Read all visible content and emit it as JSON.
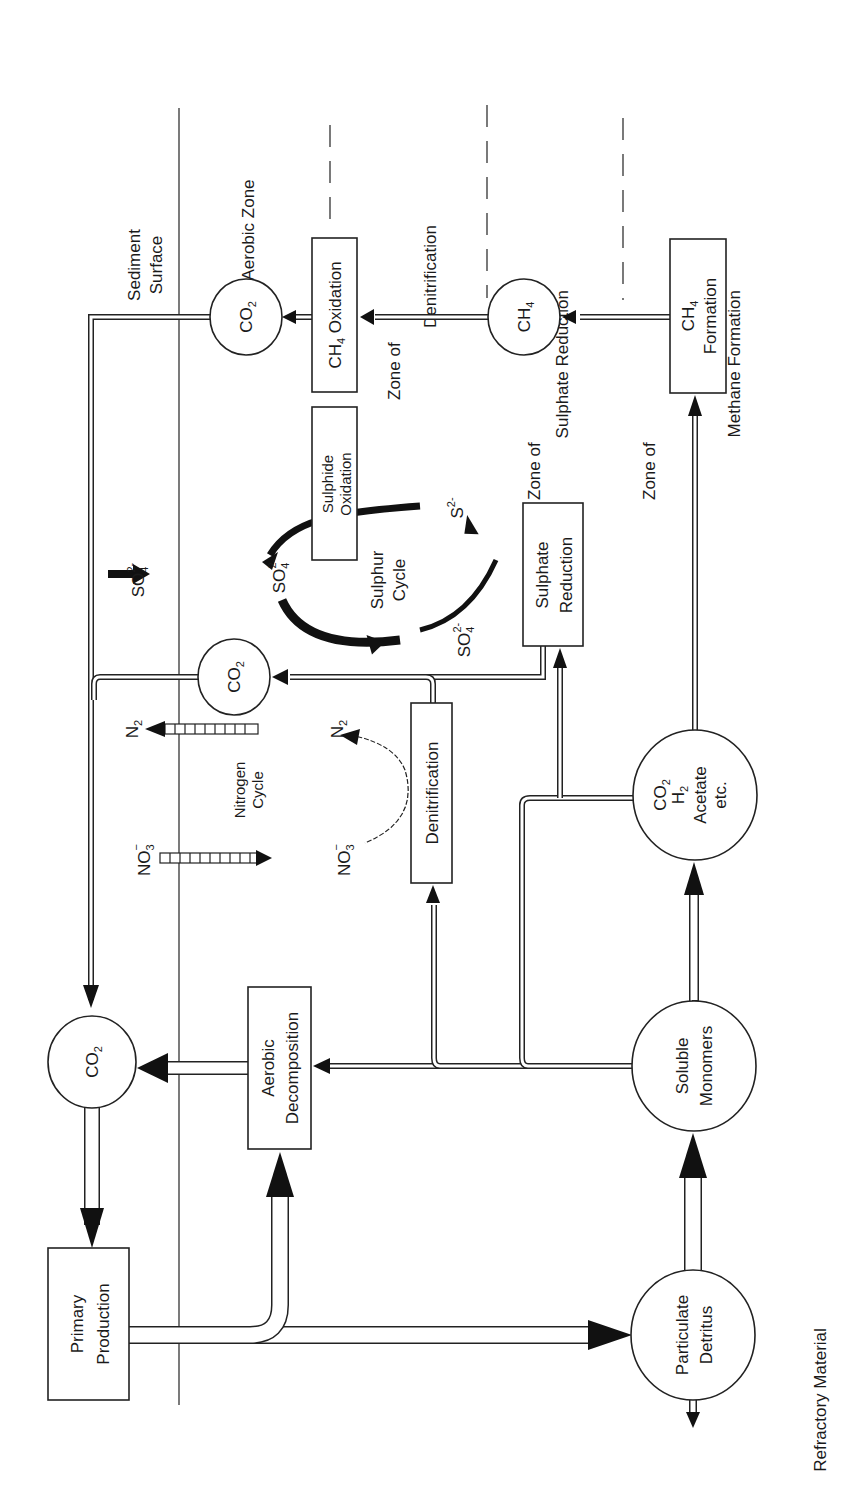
{
  "diagram": {
    "orientation": "rotated 90 degrees counter-clockwise",
    "zones": [
      {
        "id": "sediment_surface",
        "label_line1": "Sediment",
        "label_line2": "Surface",
        "boundary": "solid"
      },
      {
        "id": "aerobic",
        "label": "Aerobic  Zone",
        "boundary": "dashed"
      },
      {
        "id": "denitrification",
        "label_line1": "Zone of",
        "label_line2": "Denitrification",
        "boundary": "dashed"
      },
      {
        "id": "sulphate_reduction",
        "label_line1": "Zone of",
        "label_line2": "Sulphate Reduction",
        "boundary": "dashed"
      },
      {
        "id": "methane_formation",
        "label_line1": "Zone of",
        "label_line2": "Methane Formation"
      }
    ],
    "boxes": {
      "primary_production": {
        "line1": "Primary",
        "line2": "Production"
      },
      "aerobic_decomposition": {
        "line1": "Aerobic",
        "line2": "Decomposition"
      },
      "denitrification": {
        "line1": "Denitrification"
      },
      "sulphate_reduction": {
        "line1": "Sulphate",
        "line2": "Reduction"
      },
      "sulphide_oxidation": {
        "line1": "Sulphide",
        "line2": "Oxidation"
      },
      "ch4_oxidation": {
        "main": "CH",
        "sub": "4",
        "rest": " Oxidation"
      },
      "ch4_formation": {
        "main": "CH",
        "sub": "4",
        "line2": "Formation"
      }
    },
    "nodes": {
      "co2_main": {
        "main": "CO",
        "sub": "2"
      },
      "co2_top": {
        "main": "CO",
        "sub": "2"
      },
      "co2_mid": {
        "main": "CO",
        "sub": "2"
      },
      "ch4": {
        "main": "CH",
        "sub": "4"
      },
      "particulate_detritus": {
        "line1": "Particulate",
        "line2": "Detritus"
      },
      "soluble_monomers": {
        "line1": "Soluble",
        "line2": "Monomers"
      },
      "fermentation_products": {
        "co2": "CO",
        "co2_sub": "2",
        "h2": "H",
        "h2_sub": "2",
        "line3": "Acetate",
        "line4": "etc."
      }
    },
    "cycles": {
      "nitrogen": {
        "line1": "Nitrogen",
        "line2": "Cycle",
        "no3": "NO",
        "no3_sub": "3",
        "no3_sup": "−",
        "n2": "N",
        "n2_sub": "2"
      },
      "sulphur": {
        "line1": "Sulphur",
        "line2": "Cycle",
        "so4": "SO",
        "so4_sub": "4",
        "so4_sup": "2-",
        "s": "S",
        "s_sup": "2-"
      }
    },
    "outputs": {
      "refractory": "Refractory Material"
    }
  }
}
